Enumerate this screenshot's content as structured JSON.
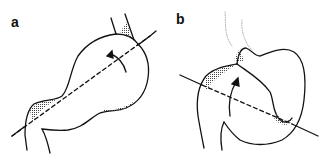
{
  "panels": [
    {
      "label": "a"
    },
    {
      "label": "b"
    }
  ],
  "colors": {
    "ink": "#111111",
    "stipple": "#555555"
  }
}
